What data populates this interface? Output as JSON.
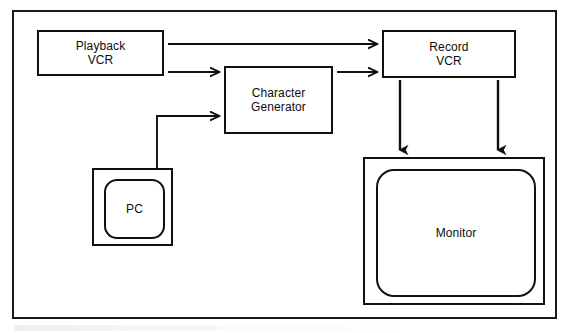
{
  "figure": {
    "border_color": "#1a1a1a",
    "line_color": "#111111",
    "background": "#ffffff",
    "width": 571,
    "height": 333
  },
  "nodes": {
    "playback_vcr": {
      "label": "Playback\nVCR",
      "shape": "rectangle",
      "x": 37,
      "y": 30,
      "w": 127,
      "h": 46
    },
    "character_generator": {
      "label": "Character\nGenerator",
      "shape": "rectangle",
      "x": 224,
      "y": 66,
      "w": 109,
      "h": 68
    },
    "record_vcr": {
      "label": "Record\nVCR",
      "shape": "rectangle",
      "x": 382,
      "y": 30,
      "w": 134,
      "h": 48
    },
    "pc": {
      "label": "PC",
      "shape": "rectangle-with-rounded-inner",
      "x": 92,
      "y": 168,
      "w": 81,
      "h": 78
    },
    "monitor": {
      "label": "Monitor",
      "shape": "rectangle-with-rounded-inner",
      "x": 363,
      "y": 157,
      "w": 182,
      "h": 148
    }
  },
  "connections": [
    {
      "name": "playback-to-record",
      "from": "playback_vcr",
      "to": "record_vcr",
      "style": "straight-arrow",
      "direction": "right"
    },
    {
      "name": "playback-to-chargen",
      "from": "playback_vcr",
      "to": "character_generator",
      "style": "straight-arrow",
      "direction": "right"
    },
    {
      "name": "chargen-to-record",
      "from": "character_generator",
      "to": "record_vcr",
      "style": "straight-arrow",
      "direction": "right"
    },
    {
      "name": "pc-to-chargen",
      "from": "pc",
      "to": "character_generator",
      "style": "elbow-arrow",
      "direction": "up-then-right"
    },
    {
      "name": "record-to-monitor-left",
      "from": "record_vcr",
      "to": "monitor",
      "style": "straight-arrow",
      "direction": "down"
    },
    {
      "name": "record-to-monitor-right",
      "from": "record_vcr",
      "to": "monitor",
      "style": "straight-arrow",
      "direction": "down"
    }
  ]
}
